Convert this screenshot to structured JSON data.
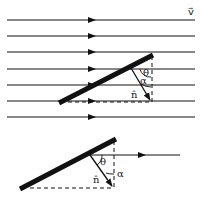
{
  "figure": {
    "top_diagram": {
      "velocity_label": "v⃗",
      "flow_lines_count": 7,
      "theta_label": "θ",
      "alpha_label": "α",
      "normal_label": "n̂"
    },
    "bottom_diagram": {
      "theta_label": "θ",
      "alpha_label": "α",
      "normal_label": "n̂"
    },
    "colors": {
      "ink": "#111111",
      "background": "#ffffff"
    }
  }
}
